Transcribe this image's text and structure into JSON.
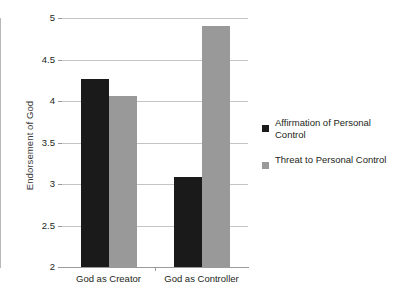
{
  "chart_data": {
    "type": "bar",
    "title": "",
    "xlabel": "",
    "ylabel": "Endorsement of God",
    "categories": [
      "God as Creator",
      "God as Controller"
    ],
    "series": [
      {
        "name": "Affirmation of Personal Control",
        "color": "#1a1a1a",
        "values": [
          4.27,
          3.08
        ]
      },
      {
        "name": "Threat to Personal Control",
        "color": "#999999",
        "values": [
          4.06,
          4.9
        ]
      }
    ],
    "ylim": [
      2,
      5
    ],
    "ytick_values": [
      5,
      4.5,
      4,
      3.5,
      3,
      2.5,
      2
    ],
    "ytick_labels": [
      "5",
      "4.5",
      "4",
      "3.5",
      "3",
      "2.5",
      "2"
    ],
    "grid": "horizontal",
    "legend_position": "right",
    "background": "#ffffff"
  }
}
